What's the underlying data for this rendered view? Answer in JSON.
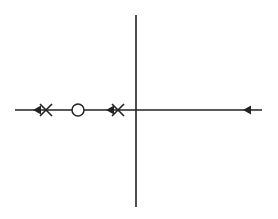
{
  "diagram": {
    "type": "root-locus",
    "width": 278,
    "height": 219,
    "stroke_color": "#222222",
    "real_axis": {
      "y": 110,
      "x1": 15,
      "x2": 262
    },
    "imag_axis": {
      "x": 136,
      "y1": 15,
      "y2": 207
    },
    "poles": [
      {
        "x": 46,
        "y": 110
      },
      {
        "x": 118,
        "y": 110
      }
    ],
    "zeros": [
      {
        "x": 78,
        "y": 110,
        "r": 6
      }
    ],
    "arrows": [
      {
        "x": 33,
        "y": 110,
        "direction": "left"
      },
      {
        "x": 106,
        "y": 110,
        "direction": "left"
      },
      {
        "x": 243,
        "y": 110,
        "direction": "left"
      }
    ]
  }
}
